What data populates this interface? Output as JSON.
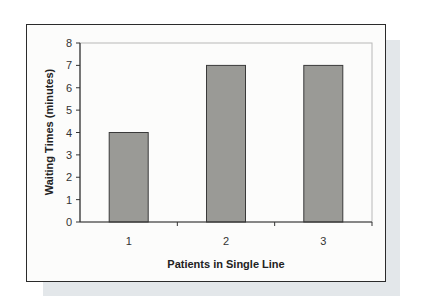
{
  "chart_data": {
    "type": "bar",
    "title": "",
    "categories": [
      "1",
      "2",
      "3"
    ],
    "values": [
      4,
      7,
      7
    ],
    "xlabel": "Patients in Single Line",
    "ylabel": "Waiting Times (minutes)",
    "ylim": [
      0,
      8
    ],
    "yticks": [
      "0",
      "1",
      "2",
      "3",
      "4",
      "5",
      "6",
      "7",
      "8"
    ],
    "grid": false,
    "legend": null,
    "bar_color": "#9a9a96",
    "bar_edge_color": "#3a3a3a"
  }
}
